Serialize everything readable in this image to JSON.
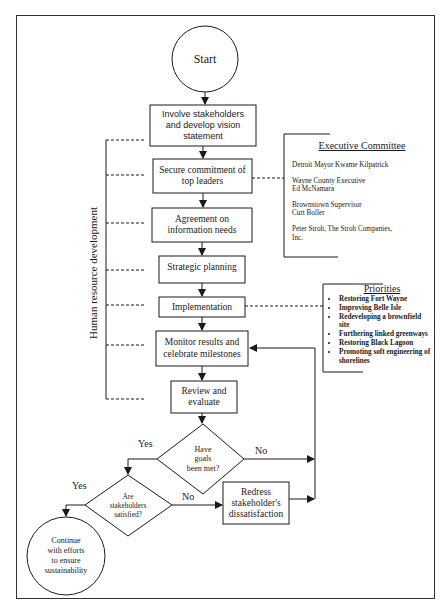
{
  "diagram": {
    "type": "flowchart",
    "nodes": {
      "start": "Start",
      "involve": [
        "Involve stakeholders",
        "and develop vision",
        "statement"
      ],
      "secure": [
        "Secure commitment of",
        "top leaders"
      ],
      "agreement": [
        "Agreement on",
        "information needs"
      ],
      "strategic": "Strategic planning",
      "implementation": "Implementation",
      "monitor": [
        "Monitor results and",
        "celebrate milestones"
      ],
      "review": [
        "Review and",
        "evaluate"
      ],
      "goals_met": [
        "Have",
        "goals",
        "been met?"
      ],
      "stakeholders_satisfied": [
        "Are",
        "stakeholders",
        "satisfied?"
      ],
      "redress": [
        "Redress",
        "stakeholder's",
        "dissatisfaction"
      ],
      "continue": [
        "Continue",
        "with efforts",
        "to ensure",
        "sustainability"
      ]
    },
    "edge_labels": {
      "goals_yes": "Yes",
      "goals_no": "No",
      "satisfied_yes": "Yes",
      "satisfied_no": "No"
    },
    "side_label": "Human resource development",
    "executive_committee": {
      "title": "Executive Committee",
      "members": [
        [
          "Detroit Mayor Kwame Kilpatrick"
        ],
        [
          "Wayne County Executive",
          "Ed McNamara"
        ],
        [
          "Brownstown Supervisor",
          "Curt Boller"
        ],
        [
          "Peter Stroh, The Stroh Companies,",
          "Inc."
        ]
      ]
    },
    "priorities": {
      "title": "Priorities",
      "items": [
        "Restoring Fort Wayne",
        "Improving Belle Isle",
        "Redeveloping a brownfield site",
        "Furthering linked greenways",
        "Restoring Black Lagoon",
        "Promoting soft engineering of shorelines"
      ]
    }
  }
}
